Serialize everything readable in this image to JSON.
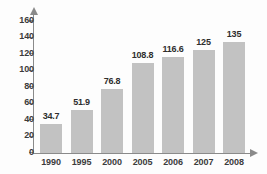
{
  "chart_data": {
    "type": "bar",
    "title": "",
    "xlabel": "",
    "ylabel": "",
    "categories": [
      "1990",
      "1995",
      "2000",
      "2005",
      "2006",
      "2007",
      "2008"
    ],
    "values": [
      34.7,
      51.9,
      76.8,
      108.8,
      116.6,
      125,
      135
    ],
    "value_labels": [
      "34.7",
      "51.9",
      "76.8",
      "108.8",
      "116.6",
      "125",
      "135"
    ],
    "ylim": [
      0,
      160
    ],
    "yticks": [
      0,
      20,
      40,
      60,
      80,
      100,
      120,
      140,
      160
    ],
    "ytick_labels": [
      "0",
      "20",
      "40",
      "60",
      "80",
      "100",
      "120",
      "140",
      "160"
    ],
    "grid": false,
    "legend": null,
    "bar_color": "#c2c2c2",
    "axis_color": "#8a8a8a",
    "label_color": "#2e2e2e"
  }
}
